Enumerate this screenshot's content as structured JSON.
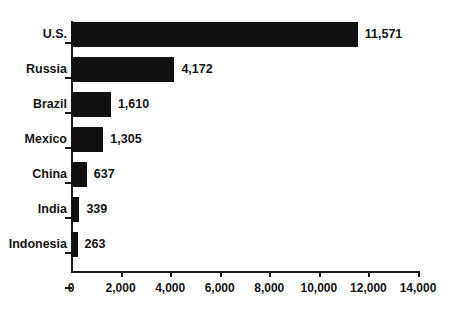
{
  "chart_data": {
    "type": "bar",
    "orientation": "horizontal",
    "title": "",
    "xlabel": "",
    "ylabel": "",
    "categories": [
      "U.S.",
      "Russia",
      "Brazil",
      "Mexico",
      "China",
      "India",
      "Indonesia"
    ],
    "values": [
      11571,
      4172,
      1610,
      1305,
      637,
      339,
      263
    ],
    "value_labels": [
      "11,571",
      "4,172",
      "1,610",
      "1,305",
      "637",
      "339",
      "263"
    ],
    "xlim": [
      0,
      14000
    ],
    "xticks": [
      0,
      2000,
      4000,
      6000,
      8000,
      10000,
      12000,
      14000
    ],
    "xtick_labels": [
      "0",
      "2,000",
      "4,000",
      "6,000",
      "8,000",
      "10,000",
      "12,000",
      "14,000"
    ],
    "grid": false,
    "legend": null,
    "bar_color": "#111111",
    "axis_color": "#1a1a1a",
    "text_color": "#151515"
  }
}
